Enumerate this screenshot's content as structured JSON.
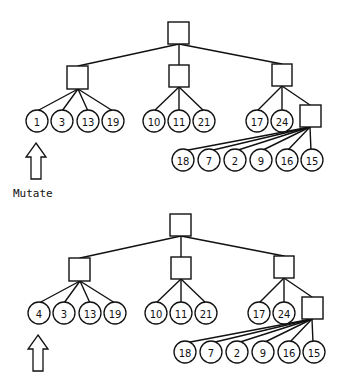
{
  "diagram": {
    "type": "tree-mutation-illustration",
    "colors": {
      "stroke": "#111111",
      "background": "#ffffff"
    },
    "caption": "Mutate",
    "trees": [
      {
        "name": "before",
        "offset": {
          "x": 0,
          "y": 0
        },
        "highlighted_leaf_index": 0,
        "groups": [
          {
            "leaves": [
              "1",
              "3",
              "13",
              "19"
            ]
          },
          {
            "leaves": [
              "10",
              "11",
              "21"
            ]
          },
          {
            "leaves": [
              "17",
              "24"
            ],
            "subgroup": {
              "leaves": [
                "18",
                "7",
                "2",
                "9",
                "16",
                "15"
              ]
            }
          }
        ]
      },
      {
        "name": "after",
        "offset": {
          "x": 2,
          "y": 192
        },
        "highlighted_leaf_index": 0,
        "groups": [
          {
            "leaves": [
              "4",
              "3",
              "13",
              "19"
            ]
          },
          {
            "leaves": [
              "10",
              "11",
              "21"
            ]
          },
          {
            "leaves": [
              "17",
              "24"
            ],
            "subgroup": {
              "leaves": [
                "18",
                "7",
                "2",
                "9",
                "16",
                "15"
              ]
            }
          }
        ]
      }
    ]
  }
}
